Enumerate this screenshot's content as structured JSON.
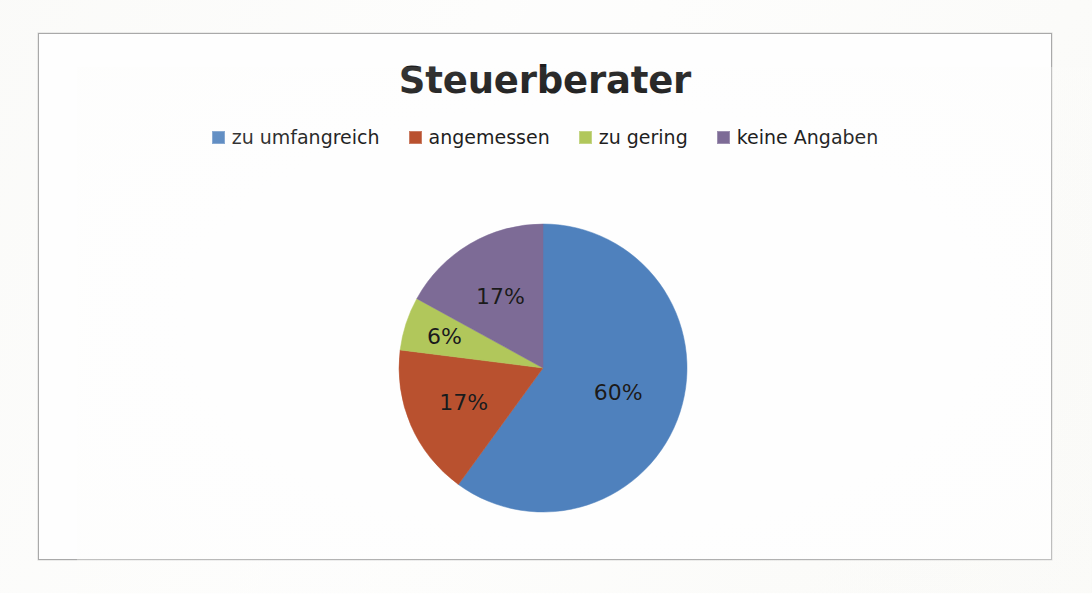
{
  "chart": {
    "title": "Steuerberater",
    "legend": [
      {
        "label": "zu umfangreich",
        "color": "#4f81bd",
        "swatch_name": "legend-swatch-blue"
      },
      {
        "label": "angemessen",
        "color": "#b9512f",
        "swatch_name": "legend-swatch-red"
      },
      {
        "label": "zu gering",
        "color": "#b1c75b",
        "swatch_name": "legend-swatch-green"
      },
      {
        "label": "keine Angaben",
        "color": "#7d6b96",
        "swatch_name": "legend-swatch-purple"
      }
    ],
    "labels": {
      "slice_0": "60%",
      "slice_1": "17%",
      "slice_2": "6%",
      "slice_3": "17%"
    }
  },
  "chart_data": {
    "type": "pie",
    "title": "Steuerberater",
    "xlabel": "",
    "ylabel": "",
    "legend_position": "top",
    "grid": false,
    "start_angle_deg": 0,
    "direction": "clockwise",
    "categories": [
      "zu umfangreich",
      "angemessen",
      "zu gering",
      "keine Angaben"
    ],
    "values": [
      60,
      17,
      6,
      17
    ],
    "value_labels": [
      "60%",
      "17%",
      "6%",
      "17%"
    ],
    "colors": [
      "#4f81bd",
      "#b9512f",
      "#b1c75b",
      "#7d6b96"
    ],
    "units": "percent",
    "series": [
      {
        "name": "Steuerberater",
        "values": [
          60,
          17,
          6,
          17
        ]
      }
    ]
  }
}
